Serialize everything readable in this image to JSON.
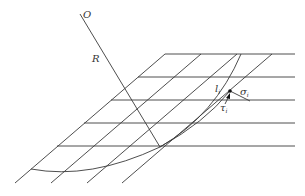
{
  "diagram": {
    "labels": {
      "center": "O",
      "radius": "R",
      "length": "l",
      "length_sub": "i",
      "normal_stress": "σ",
      "normal_stress_sub": "i",
      "shear_stress": "τ",
      "shear_stress_sub": "i"
    },
    "grid": {
      "horizontal_lines_y": [
        54,
        77,
        100,
        123,
        146
      ],
      "horizontal_lines_x_start": [
        165,
        138,
        111,
        84,
        57
      ],
      "horizontal_lines_x_end": 295,
      "diagonal_top_x": [
        165,
        201,
        237,
        272
      ],
      "diagonal_bottom_x": [
        15,
        51,
        87,
        122
      ]
    },
    "colors": {
      "line": "#3a3a3a",
      "text": "#333333",
      "background": "#ffffff"
    }
  }
}
